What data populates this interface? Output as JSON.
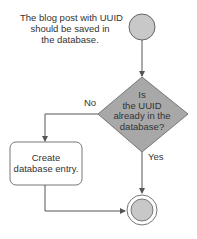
{
  "diagram": {
    "type": "flowchart",
    "start_note": [
      "The blog post with UUID",
      "should be saved in",
      "the database."
    ],
    "decision": [
      "Is",
      "the UUID",
      "already in the",
      "database?"
    ],
    "action": [
      "Create",
      "database entry."
    ],
    "edges": {
      "no_label": "No",
      "yes_label": "Yes"
    },
    "colors": {
      "node_fill": "#c8c8c8",
      "stroke": "#555555",
      "text": "#333333"
    }
  }
}
